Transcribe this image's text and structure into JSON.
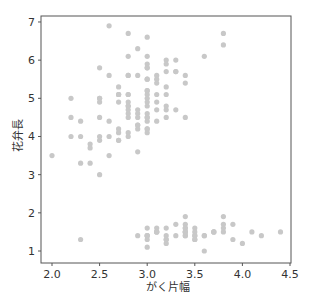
{
  "chart_data": {
    "type": "scatter",
    "title": "",
    "xlabel": "がく片幅",
    "ylabel": "花弁長",
    "xlim": [
      1.88,
      4.52
    ],
    "ylim": [
      0.7,
      7.25
    ],
    "xticks": [
      2.0,
      2.5,
      3.0,
      3.5,
      4.0,
      4.5
    ],
    "xtick_labels": [
      "2.0",
      "2.5",
      "3.0",
      "3.5",
      "4.0",
      "4.5"
    ],
    "yticks": [
      1,
      2,
      3,
      4,
      5,
      6,
      7
    ],
    "ytick_labels": [
      "1",
      "2",
      "3",
      "4",
      "5",
      "6",
      "7"
    ],
    "grid": false,
    "legend": null,
    "marker_color": "#c8c8c8",
    "axis_color": "#555555",
    "points": [
      [
        3.5,
        1.4
      ],
      [
        3.0,
        1.4
      ],
      [
        3.2,
        1.3
      ],
      [
        3.1,
        1.5
      ],
      [
        3.6,
        1.4
      ],
      [
        3.9,
        1.7
      ],
      [
        3.4,
        1.4
      ],
      [
        3.4,
        1.5
      ],
      [
        2.9,
        1.4
      ],
      [
        3.1,
        1.5
      ],
      [
        3.7,
        1.5
      ],
      [
        3.4,
        1.6
      ],
      [
        3.0,
        1.4
      ],
      [
        3.0,
        1.1
      ],
      [
        4.0,
        1.2
      ],
      [
        4.4,
        1.5
      ],
      [
        3.9,
        1.3
      ],
      [
        3.5,
        1.4
      ],
      [
        3.8,
        1.7
      ],
      [
        3.8,
        1.5
      ],
      [
        3.4,
        1.7
      ],
      [
        3.7,
        1.5
      ],
      [
        3.6,
        1.0
      ],
      [
        3.3,
        1.7
      ],
      [
        3.4,
        1.9
      ],
      [
        3.0,
        1.6
      ],
      [
        3.4,
        1.6
      ],
      [
        3.5,
        1.5
      ],
      [
        3.4,
        1.4
      ],
      [
        3.2,
        1.6
      ],
      [
        3.1,
        1.6
      ],
      [
        3.4,
        1.5
      ],
      [
        4.1,
        1.5
      ],
      [
        4.2,
        1.4
      ],
      [
        3.1,
        1.5
      ],
      [
        3.2,
        1.2
      ],
      [
        3.5,
        1.3
      ],
      [
        3.6,
        1.4
      ],
      [
        3.0,
        1.3
      ],
      [
        3.4,
        1.5
      ],
      [
        3.5,
        1.3
      ],
      [
        2.3,
        1.3
      ],
      [
        3.2,
        1.3
      ],
      [
        3.5,
        1.6
      ],
      [
        3.8,
        1.9
      ],
      [
        3.0,
        1.4
      ],
      [
        3.8,
        1.6
      ],
      [
        3.2,
        1.4
      ],
      [
        3.7,
        1.5
      ],
      [
        3.3,
        1.4
      ],
      [
        3.2,
        4.7
      ],
      [
        3.2,
        4.5
      ],
      [
        3.1,
        4.9
      ],
      [
        2.3,
        4.0
      ],
      [
        2.8,
        4.6
      ],
      [
        2.8,
        4.5
      ],
      [
        3.3,
        4.7
      ],
      [
        2.4,
        3.3
      ],
      [
        2.9,
        4.6
      ],
      [
        2.7,
        3.9
      ],
      [
        2.0,
        3.5
      ],
      [
        3.0,
        4.2
      ],
      [
        2.2,
        4.0
      ],
      [
        2.9,
        4.7
      ],
      [
        2.9,
        3.6
      ],
      [
        3.1,
        4.4
      ],
      [
        3.0,
        4.5
      ],
      [
        2.7,
        4.1
      ],
      [
        2.2,
        4.5
      ],
      [
        2.5,
        3.9
      ],
      [
        3.2,
        4.8
      ],
      [
        2.8,
        4.0
      ],
      [
        2.5,
        4.9
      ],
      [
        2.8,
        4.7
      ],
      [
        2.9,
        4.3
      ],
      [
        3.0,
        4.4
      ],
      [
        2.8,
        4.8
      ],
      [
        3.0,
        5.0
      ],
      [
        2.9,
        4.5
      ],
      [
        2.6,
        3.5
      ],
      [
        2.4,
        3.8
      ],
      [
        2.4,
        3.7
      ],
      [
        2.7,
        3.9
      ],
      [
        2.7,
        5.1
      ],
      [
        3.0,
        4.5
      ],
      [
        3.4,
        4.5
      ],
      [
        3.1,
        4.7
      ],
      [
        2.3,
        4.4
      ],
      [
        3.0,
        4.1
      ],
      [
        2.5,
        4.0
      ],
      [
        2.6,
        4.4
      ],
      [
        3.0,
        4.6
      ],
      [
        2.6,
        4.0
      ],
      [
        2.3,
        3.3
      ],
      [
        2.7,
        4.2
      ],
      [
        3.0,
        4.2
      ],
      [
        2.9,
        4.2
      ],
      [
        2.9,
        4.3
      ],
      [
        2.5,
        3.0
      ],
      [
        2.8,
        4.1
      ],
      [
        3.3,
        6.0
      ],
      [
        2.7,
        5.1
      ],
      [
        3.0,
        5.9
      ],
      [
        2.9,
        5.6
      ],
      [
        3.0,
        5.8
      ],
      [
        3.0,
        6.6
      ],
      [
        2.5,
        4.5
      ],
      [
        2.9,
        6.3
      ],
      [
        2.5,
        5.8
      ],
      [
        3.6,
        6.1
      ],
      [
        3.2,
        5.1
      ],
      [
        2.7,
        5.3
      ],
      [
        3.0,
        5.5
      ],
      [
        2.5,
        5.0
      ],
      [
        2.8,
        5.1
      ],
      [
        3.2,
        5.3
      ],
      [
        3.0,
        5.5
      ],
      [
        3.8,
        6.7
      ],
      [
        2.6,
        6.9
      ],
      [
        2.2,
        5.0
      ],
      [
        3.2,
        5.7
      ],
      [
        2.8,
        4.9
      ],
      [
        2.8,
        6.7
      ],
      [
        2.7,
        4.9
      ],
      [
        3.3,
        5.7
      ],
      [
        3.2,
        6.0
      ],
      [
        2.8,
        4.8
      ],
      [
        3.0,
        4.9
      ],
      [
        2.8,
        5.6
      ],
      [
        3.0,
        5.8
      ],
      [
        2.8,
        6.1
      ],
      [
        3.8,
        6.4
      ],
      [
        2.8,
        5.6
      ],
      [
        2.8,
        5.1
      ],
      [
        2.6,
        5.6
      ],
      [
        3.0,
        6.1
      ],
      [
        3.4,
        5.6
      ],
      [
        3.1,
        5.5
      ],
      [
        3.0,
        4.8
      ],
      [
        3.1,
        5.4
      ],
      [
        3.1,
        5.6
      ],
      [
        3.1,
        5.1
      ],
      [
        2.7,
        5.1
      ],
      [
        3.2,
        5.9
      ],
      [
        3.3,
        5.7
      ],
      [
        3.0,
        5.2
      ],
      [
        2.5,
        5.0
      ],
      [
        3.0,
        5.2
      ],
      [
        3.4,
        5.4
      ],
      [
        3.0,
        5.1
      ]
    ]
  }
}
